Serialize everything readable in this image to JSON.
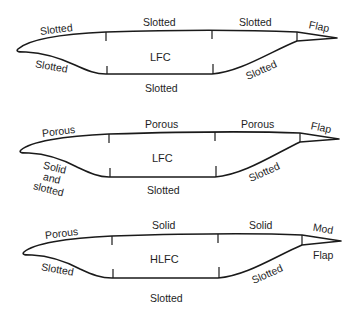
{
  "diagram": {
    "airfoils": [
      {
        "type": "LFC",
        "labels": {
          "center": "LFC",
          "upper_leading": "Slotted",
          "upper_mid": "Slotted",
          "upper_aft": "Slotted",
          "trailing_upper": "Flap",
          "lower_leading": "Slotted",
          "lower_mid": "Slotted",
          "lower_aft": "Slotted"
        }
      },
      {
        "type": "LFC",
        "labels": {
          "center": "LFC",
          "upper_leading": "Porous",
          "upper_mid": "Porous",
          "upper_aft": "Porous",
          "trailing_upper": "Flap",
          "lower_leading_line1": "Solid",
          "lower_leading_line2": "and",
          "lower_leading_line3": "slotted",
          "lower_mid": "Slotted",
          "lower_aft": "Slotted"
        }
      },
      {
        "type": "HLFC",
        "labels": {
          "center": "HLFC",
          "upper_leading": "Porous",
          "upper_mid": "Solid",
          "upper_aft": "Solid",
          "trailing_upper": "Mod",
          "trailing_lower": "Flap",
          "lower_leading": "Slotted",
          "lower_mid": "Slotted",
          "lower_aft": "Slotted"
        }
      }
    ]
  }
}
